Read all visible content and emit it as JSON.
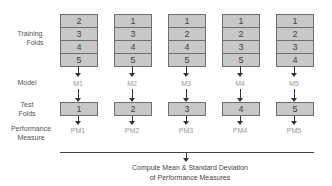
{
  "row_labels": {
    "training_folds": "Training\nFolds",
    "training_line1": "Training",
    "training_line2": "Folds",
    "model": "Model",
    "test_line1": "Test",
    "test_line2": "Folds",
    "performance_line1": "Performance",
    "performance_line2": "Measure"
  },
  "columns": [
    {
      "training_folds": [
        "2",
        "3",
        "4",
        "5"
      ],
      "model": "M1",
      "test_fold": "1",
      "performance": "PM1"
    },
    {
      "training_folds": [
        "1",
        "3",
        "4",
        "5"
      ],
      "model": "M2",
      "test_fold": "2",
      "performance": "PM2"
    },
    {
      "training_folds": [
        "1",
        "2",
        "4",
        "5"
      ],
      "model": "M3",
      "test_fold": "3",
      "performance": "PM3"
    },
    {
      "training_folds": [
        "1",
        "2",
        "3",
        "5"
      ],
      "model": "M4",
      "test_fold": "4",
      "performance": "PM4"
    },
    {
      "training_folds": [
        "1",
        "2",
        "3",
        "4"
      ],
      "model": "M5",
      "test_fold": "5",
      "performance": "PM5"
    }
  ],
  "summary": {
    "line1": "Compute Mean & Standard Deviation",
    "line2": "of Performance Measures"
  },
  "colors": {
    "box_fill": "#c8c8c8",
    "box_border": "#6f6f6f",
    "label_gray": "#9a9a9a"
  }
}
